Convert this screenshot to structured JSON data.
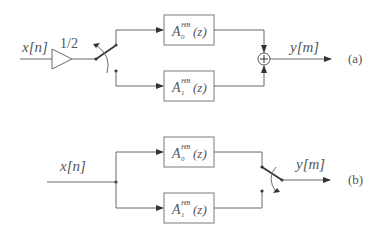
{
  "diagram_a": {
    "label": "(a)",
    "input": "x[n]",
    "gain": "1/2",
    "filters": [
      {
        "symbol": "A",
        "subscript": "0",
        "superscript": "HB",
        "arg": "(z)"
      },
      {
        "symbol": "A",
        "subscript": "1",
        "superscript": "HB",
        "arg": "(z)"
      }
    ],
    "adder": "+",
    "output": "y[m]"
  },
  "diagram_b": {
    "label": "(b)",
    "input": "x[n]",
    "filters": [
      {
        "symbol": "A",
        "subscript": "0",
        "superscript": "HB",
        "arg": "(z)"
      },
      {
        "symbol": "A",
        "subscript": "1",
        "superscript": "HB",
        "arg": "(z)"
      }
    ],
    "output": "y[m]"
  },
  "colors": {
    "line": "#6a6a6a",
    "text": "#555555",
    "arrow": "#333333"
  }
}
